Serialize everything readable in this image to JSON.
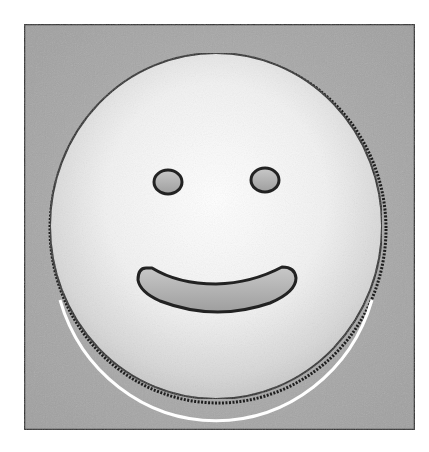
{
  "illustration": {
    "subject": "smiley face coin",
    "background_square": {
      "x": 24,
      "y": 24,
      "width": 391,
      "height": 406,
      "fill": "#a9a9a9",
      "stroke": "#2a2a2a"
    },
    "coin": {
      "cx": 216,
      "cy": 226,
      "rx": 167,
      "ry": 174,
      "fill": "#eeeeee",
      "rim_stroke": "#222222"
    },
    "left_eye": {
      "cx": 168,
      "cy": 182,
      "rx": 14,
      "ry": 12
    },
    "right_eye": {
      "cx": 265,
      "cy": 180,
      "rx": 14,
      "ry": 12
    },
    "mouth": {
      "left_x": 137,
      "right_x": 297,
      "top_y": 267,
      "bottom_y": 313
    },
    "colors": {
      "page": "#ffffff",
      "shadow": "#8a8a8a",
      "highlight": "#ffffff",
      "outline": "#222222"
    }
  }
}
